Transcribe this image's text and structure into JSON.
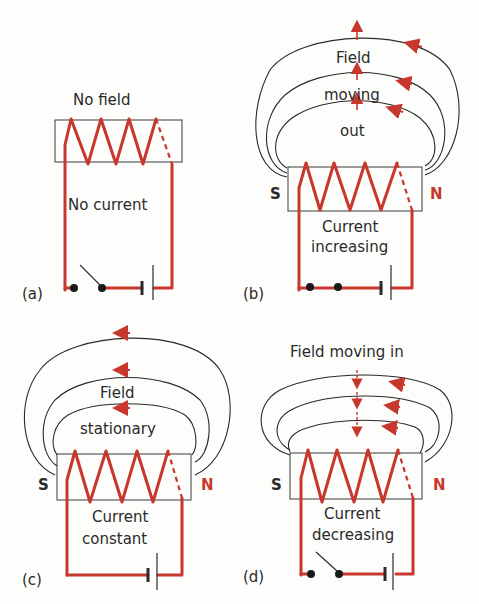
{
  "colors": {
    "wire": "#c8372d",
    "ink": "#2a2a2a",
    "background": "#fdfdfb"
  },
  "panels": [
    {
      "id": "a",
      "label": "(a)",
      "top_text": "No field",
      "inner_text": [
        "No current"
      ],
      "switch": "open",
      "field_lines": 0,
      "poles": null
    },
    {
      "id": "b",
      "label": "(b)",
      "field_text": [
        "Field",
        "moving",
        "out"
      ],
      "inner_text": [
        "Current",
        "increasing"
      ],
      "switch": "closed",
      "field_lines": 3,
      "field_motion": "outward",
      "poles": {
        "left": "S",
        "right": "N"
      }
    },
    {
      "id": "c",
      "label": "(c)",
      "field_text": [
        "Field",
        "stationary"
      ],
      "inner_text": [
        "Current",
        "constant"
      ],
      "switch": "none",
      "field_lines": 3,
      "field_motion": "none",
      "poles": {
        "left": "S",
        "right": "N"
      }
    },
    {
      "id": "d",
      "label": "(d)",
      "top_text": "Field moving in",
      "inner_text": [
        "Current",
        "decreasing"
      ],
      "switch": "open",
      "field_lines": 3,
      "field_motion": "inward",
      "poles": {
        "left": "S",
        "right": "N"
      }
    }
  ]
}
